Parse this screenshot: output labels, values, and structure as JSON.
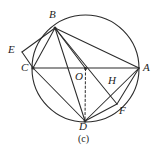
{
  "figure": {
    "caption": "(c)",
    "caption_pos": {
      "x": 78,
      "y": 134
    },
    "stroke_color": "#2b2b2b",
    "label_color": "#1d1d1d",
    "background": "#ffffff",
    "canvas": {
      "width": 161,
      "height": 153
    },
    "circle": {
      "name": "circumcircle",
      "cx": 85.5,
      "cy": 68.5,
      "r": 53.5
    },
    "points": [
      {
        "id": "A",
        "label": "A",
        "x": 139,
        "y": 68,
        "label_x": 143,
        "label_y": 62,
        "on_circle": true,
        "dot": false
      },
      {
        "id": "B",
        "label": "B",
        "x": 55,
        "y": 28,
        "label_x": 49,
        "label_y": 9,
        "on_circle": true,
        "dot": true
      },
      {
        "id": "C",
        "label": "C",
        "x": 33,
        "y": 68,
        "label_x": 21,
        "label_y": 62,
        "on_circle": true,
        "dot": true
      },
      {
        "id": "D",
        "label": "D",
        "x": 85,
        "y": 121,
        "label_x": 79,
        "label_y": 121,
        "on_circle": true,
        "dot": true
      },
      {
        "id": "E",
        "label": "E",
        "x": 22,
        "y": 52,
        "label_x": 8,
        "label_y": 44,
        "on_circle": false,
        "dot": false
      },
      {
        "id": "F",
        "label": "F",
        "x": 117,
        "y": 104,
        "label_x": 119,
        "label_y": 105,
        "on_circle": true,
        "dot": false
      },
      {
        "id": "H",
        "label": "H",
        "x": 109,
        "y": 80,
        "label_x": 108,
        "label_y": 75,
        "on_circle": false,
        "dot": false
      },
      {
        "id": "O",
        "label": "O",
        "x": 85.5,
        "y": 68.5,
        "label_x": 75,
        "label_y": 71,
        "on_circle": false,
        "dot": true
      }
    ],
    "segments": [
      {
        "name": "segment-CA",
        "from": "C",
        "to": "A",
        "style": "solid"
      },
      {
        "name": "segment-BC",
        "from": "B",
        "to": "C",
        "style": "solid"
      },
      {
        "name": "segment-BA",
        "from": "B",
        "to": "A",
        "style": "solid"
      },
      {
        "name": "segment-BD",
        "from": "B",
        "to": "D",
        "style": "solid"
      },
      {
        "name": "segment-BO",
        "from": "B",
        "to": "O",
        "style": "solid"
      },
      {
        "name": "segment-BH",
        "from": "B",
        "to": "F",
        "style": "solid"
      },
      {
        "name": "segment-BE",
        "from": "B",
        "to": "E",
        "style": "solid"
      },
      {
        "name": "segment-EC",
        "from": "E",
        "to": "C",
        "style": "solid"
      },
      {
        "name": "segment-CD",
        "from": "C",
        "to": "D",
        "style": "solid"
      },
      {
        "name": "segment-DA",
        "from": "D",
        "to": "A",
        "style": "solid"
      },
      {
        "name": "segment-DF",
        "from": "D",
        "to": "F",
        "style": "solid"
      },
      {
        "name": "segment-AF",
        "from": "A",
        "to": "F",
        "style": "solid"
      },
      {
        "name": "segment-OD",
        "from": "O",
        "to": "D",
        "style": "dashed"
      }
    ]
  }
}
